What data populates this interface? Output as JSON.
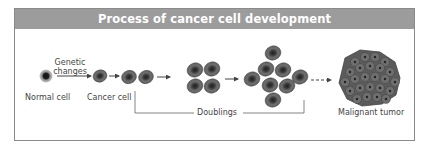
{
  "diagram": {
    "title": "Process of cancer cell development",
    "labels": {
      "normal_cell": "Normal cell",
      "genetic_changes_line1": "Genetic",
      "genetic_changes_line2": "changes",
      "cancer_cell": "Cancer cell",
      "doublings": "Doublings",
      "malignant_tumor": "Malignant tumor"
    },
    "stages": [
      {
        "name": "normal-cell",
        "cell_count": 1
      },
      {
        "name": "cancer-cell",
        "cell_count": 1
      },
      {
        "name": "first-doubling",
        "cell_count": 2
      },
      {
        "name": "second-doubling",
        "cell_count": 4
      },
      {
        "name": "third-doubling",
        "cell_count": 8
      },
      {
        "name": "malignant-tumor",
        "cell_count": "many"
      }
    ],
    "colors": {
      "title_bar": "#9c9c9c",
      "title_text": "#ffffff",
      "border": "#8a8a8a",
      "cell_fill": "#6e6e6e",
      "cell_nucleus": "#2a2a2a",
      "text": "#444444"
    }
  }
}
